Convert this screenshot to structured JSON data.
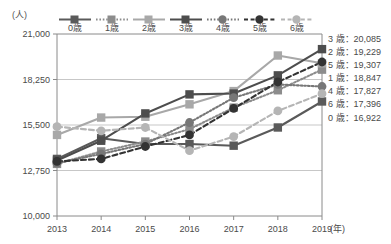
{
  "axis": {
    "unit_label": "(人)",
    "x_unit_label": "(年)"
  },
  "legend": {
    "items": [
      {
        "label": "0歳",
        "color": "#5a5a5a",
        "dash": "solid",
        "marker": "square"
      },
      {
        "label": "1歳",
        "color": "#8c8c8c",
        "dash": "dotted",
        "marker": "square"
      },
      {
        "label": "2歳",
        "color": "#a8a8a8",
        "dash": "solid",
        "marker": "square"
      },
      {
        "label": "3歳",
        "color": "#4d4d4d",
        "dash": "solid",
        "marker": "square"
      },
      {
        "label": "4歳",
        "color": "#777777",
        "dash": "dotted",
        "marker": "circle"
      },
      {
        "label": "5歳",
        "color": "#333333",
        "dash": "dashed",
        "marker": "circle"
      },
      {
        "label": "6歳",
        "color": "#b5b5b5",
        "dash": "dashed",
        "marker": "circle"
      }
    ]
  },
  "values_panel": {
    "rows": [
      {
        "label": "3 歳：",
        "value": "20,085"
      },
      {
        "label": "2 歳：",
        "value": "19,229"
      },
      {
        "label": "5 歳：",
        "value": "19,307"
      },
      {
        "label": "1 歳：",
        "value": "18,847"
      },
      {
        "label": "4 歳：",
        "value": "17,827"
      },
      {
        "label": "6 歳：",
        "value": "17,396"
      },
      {
        "label": "0 歳：",
        "value": "16,922"
      }
    ]
  },
  "chart_data": {
    "type": "line",
    "title": "",
    "xlabel": "(年)",
    "ylabel": "(人)",
    "x": [
      "2013",
      "2014",
      "2015",
      "2016",
      "2017",
      "2018",
      "2019"
    ],
    "ylim": [
      10000,
      21000
    ],
    "yticks": [
      10000,
      12750,
      15500,
      18250,
      21000
    ],
    "ytick_labels": [
      "10,000",
      "12,750",
      "15,500",
      "18,250",
      "21,000"
    ],
    "grid": "horizontal",
    "legend_position": "top",
    "series": [
      {
        "name": "0歳",
        "color": "#5a5a5a",
        "dash": "solid",
        "marker": "square",
        "values": [
          13450,
          14700,
          14350,
          14350,
          14250,
          15350,
          16922
        ]
      },
      {
        "name": "1歳",
        "color": "#8c8c8c",
        "dash": "dotted",
        "marker": "square",
        "values": [
          13150,
          13900,
          14500,
          15250,
          16550,
          17600,
          18847
        ]
      },
      {
        "name": "2歳",
        "color": "#a8a8a8",
        "dash": "solid",
        "marker": "square",
        "values": [
          14900,
          15950,
          16000,
          16750,
          17550,
          19700,
          19229
        ]
      },
      {
        "name": "3歳",
        "color": "#4d4d4d",
        "dash": "solid",
        "marker": "square",
        "values": [
          13350,
          14550,
          16200,
          17350,
          17400,
          18500,
          20085
        ]
      },
      {
        "name": "4歳",
        "color": "#777777",
        "dash": "dotted",
        "marker": "circle",
        "values": [
          13200,
          13750,
          14350,
          15650,
          17150,
          17950,
          17827
        ]
      },
      {
        "name": "5歳",
        "color": "#333333",
        "dash": "dashed",
        "marker": "circle",
        "values": [
          13300,
          13450,
          14200,
          14900,
          16500,
          18100,
          19307
        ]
      },
      {
        "name": "6歳",
        "color": "#b5b5b5",
        "dash": "dashed",
        "marker": "circle",
        "values": [
          15400,
          15150,
          15350,
          13950,
          14800,
          16350,
          17396
        ]
      }
    ]
  }
}
